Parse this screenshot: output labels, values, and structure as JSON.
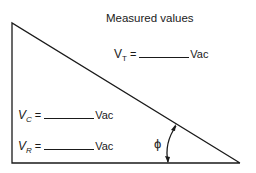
{
  "title": "Measured values",
  "equations": {
    "vt": {
      "symbol": "V",
      "subscript": "T",
      "equals": "=",
      "unit": "Vac"
    },
    "vc": {
      "symbol": "V",
      "subscript": "C",
      "equals": "=",
      "unit": "Vac"
    },
    "vr": {
      "symbol": "V",
      "subscript": "R",
      "equals": "=",
      "unit": "Vac"
    }
  },
  "angle_label": "ϕ",
  "colors": {
    "line": "#1a1a1a",
    "background": "#ffffff"
  }
}
